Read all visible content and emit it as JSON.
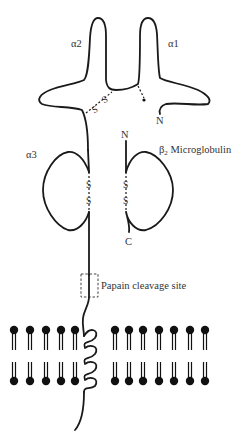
{
  "diagram": {
    "labels": {
      "alpha1": "α1",
      "alpha2": "α2",
      "alpha3": "α3",
      "alpha1_n_terminus": "N",
      "beta2_name": "β",
      "beta2_subscript": "2",
      "beta2_rest": " Microglobulin",
      "beta2_n_terminus": "N",
      "beta2_c_terminus": "C",
      "papain": "Papain cleavage site",
      "disulfide_s": "S"
    },
    "membrane": {
      "left_lipid_count": 5,
      "right_lipid_count": 7
    },
    "colors": {
      "line": "#1a1a1a",
      "text": "#333333",
      "background": "#ffffff"
    }
  }
}
